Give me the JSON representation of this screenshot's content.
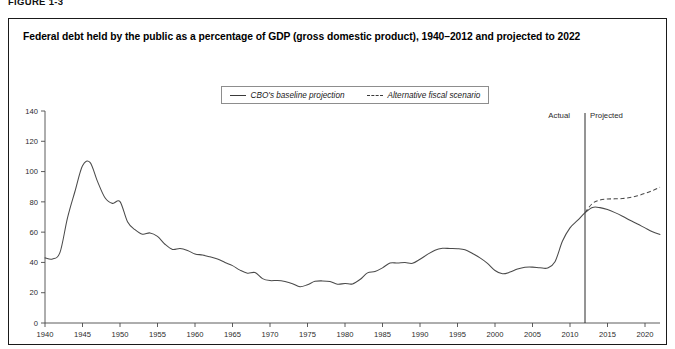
{
  "figure": {
    "label": "FIGURE 1-3",
    "title": "Federal debt held by the public as a percentage of GDP (gross domestic product), 1940–2012 and projected to 2022"
  },
  "legend": {
    "entries": [
      {
        "label": "CBO's baseline projection",
        "style": "solid",
        "icon": "solid-line-swatch"
      },
      {
        "label": "Alternative fiscal scenario",
        "style": "dashed",
        "icon": "dashed-line-swatch"
      }
    ]
  },
  "annotations": {
    "actual_label": "Actual",
    "projected_label": "Projected",
    "divider_year": 2012
  },
  "chart_data": {
    "type": "line",
    "title": "Federal debt held by the public as a percentage of GDP (gross domestic product), 1940–2012 and projected to 2022",
    "xlabel": "",
    "ylabel": "",
    "xlim": [
      1940,
      2022
    ],
    "ylim": [
      0,
      140
    ],
    "yticks": [
      0,
      20,
      40,
      60,
      80,
      100,
      120,
      140
    ],
    "xticks": [
      1940,
      1945,
      1950,
      1955,
      1960,
      1965,
      1970,
      1975,
      1980,
      1985,
      1990,
      1995,
      2000,
      2005,
      2010,
      2015,
      2020
    ],
    "grid": false,
    "legend_position": "top-center",
    "series": [
      {
        "name": "CBO's baseline projection",
        "style": "solid",
        "x": [
          1940,
          1941,
          1942,
          1943,
          1944,
          1945,
          1946,
          1947,
          1948,
          1949,
          1950,
          1951,
          1952,
          1953,
          1954,
          1955,
          1956,
          1957,
          1958,
          1959,
          1960,
          1961,
          1962,
          1963,
          1964,
          1965,
          1966,
          1967,
          1968,
          1969,
          1970,
          1971,
          1972,
          1973,
          1974,
          1975,
          1976,
          1977,
          1978,
          1979,
          1980,
          1981,
          1982,
          1983,
          1984,
          1985,
          1986,
          1987,
          1988,
          1989,
          1990,
          1991,
          1992,
          1993,
          1994,
          1995,
          1996,
          1997,
          1998,
          1999,
          2000,
          2001,
          2002,
          2003,
          2004,
          2005,
          2006,
          2007,
          2008,
          2009,
          2010,
          2011,
          2012,
          2013,
          2014,
          2015,
          2016,
          2017,
          2018,
          2019,
          2020,
          2021,
          2022
        ],
        "values": [
          43.0,
          42.3,
          46.6,
          69.4,
          87.0,
          103.9,
          106.1,
          93.5,
          82.7,
          79.0,
          80.2,
          66.9,
          61.6,
          58.6,
          59.5,
          57.2,
          52.0,
          48.6,
          49.2,
          47.9,
          45.6,
          44.9,
          43.7,
          42.3,
          40.0,
          37.9,
          34.9,
          32.9,
          33.3,
          29.3,
          28.0,
          28.1,
          27.4,
          26.0,
          23.9,
          25.3,
          27.5,
          27.8,
          27.4,
          25.6,
          26.1,
          25.8,
          28.7,
          33.1,
          34.0,
          36.4,
          39.6,
          39.6,
          39.9,
          39.4,
          42.1,
          45.3,
          48.1,
          49.3,
          49.2,
          49.1,
          48.4,
          45.9,
          43.0,
          39.4,
          34.7,
          32.5,
          33.6,
          35.6,
          36.8,
          36.9,
          36.5,
          36.3,
          40.5,
          54.1,
          62.8,
          67.7,
          72.8,
          76.3,
          76.2,
          74.9,
          72.9,
          70.5,
          67.8,
          65.4,
          62.8,
          60.3,
          58.5
        ]
      },
      {
        "name": "Alternative fiscal scenario",
        "style": "dashed",
        "x": [
          2012,
          2013,
          2014,
          2015,
          2016,
          2017,
          2018,
          2019,
          2020,
          2021,
          2022
        ],
        "values": [
          72.8,
          79.0,
          81.2,
          81.9,
          82.0,
          82.2,
          82.9,
          84.0,
          85.6,
          87.4,
          89.7
        ]
      }
    ]
  }
}
